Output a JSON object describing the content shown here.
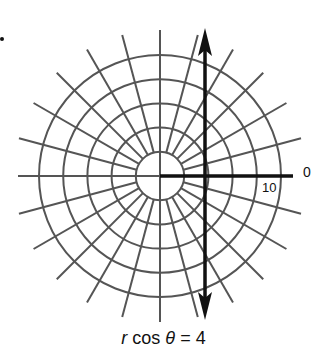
{
  "figure": {
    "type": "polar-grid-diagram",
    "center": [
      160,
      176
    ],
    "circle_values": [
      2,
      4,
      6,
      8,
      10
    ],
    "radial_line_step_degrees": 15,
    "line_equation_x": 4,
    "colors": {
      "grid": "#555555",
      "axis": "#111111",
      "line": "#111111"
    }
  },
  "labels": {
    "angle_zero": "0",
    "radius_ten": "10",
    "caption_r": "r",
    "caption_cos": " cos ",
    "caption_theta": "θ",
    "caption_rest": " = 4"
  }
}
